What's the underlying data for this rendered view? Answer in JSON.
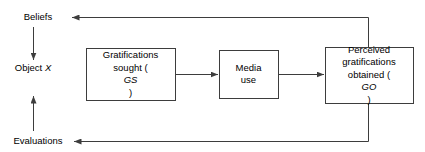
{
  "diagram": {
    "line_color": "#3d3d3d",
    "box_border_color": "#3d3d3d",
    "text_color": "#000000",
    "background": "#ffffff",
    "stages": [
      {
        "id": "beliefs",
        "label": "Beliefs"
      },
      {
        "id": "object",
        "label": "Object",
        "sub_label": "X"
      },
      {
        "id": "evaluations",
        "label": "Evaluations"
      }
    ],
    "boxes": [
      {
        "id": "gratifications-sought",
        "line1": "Gratifications",
        "line2_prefix": "sought (",
        "line2_italic": "GS",
        "line2_suffix": ")"
      },
      {
        "id": "media-use",
        "line1": "Media",
        "line2": "use"
      },
      {
        "id": "perceived-gratifications-obtained",
        "line1": "Perceived",
        "line2": "gratifications",
        "line3_prefix": "obtained (",
        "line3_italic": "GO",
        "line3_suffix": ")"
      }
    ],
    "connectors": [
      {
        "id": "beliefs-to-object",
        "direction": "down"
      },
      {
        "id": "evaluations-to-object",
        "direction": "up"
      },
      {
        "id": "gs-to-media",
        "direction": "right"
      },
      {
        "id": "media-to-go",
        "direction": "right"
      },
      {
        "id": "go-to-beliefs-feedback",
        "direction": "left"
      },
      {
        "id": "go-to-evaluations-feedback",
        "direction": "left"
      }
    ]
  }
}
